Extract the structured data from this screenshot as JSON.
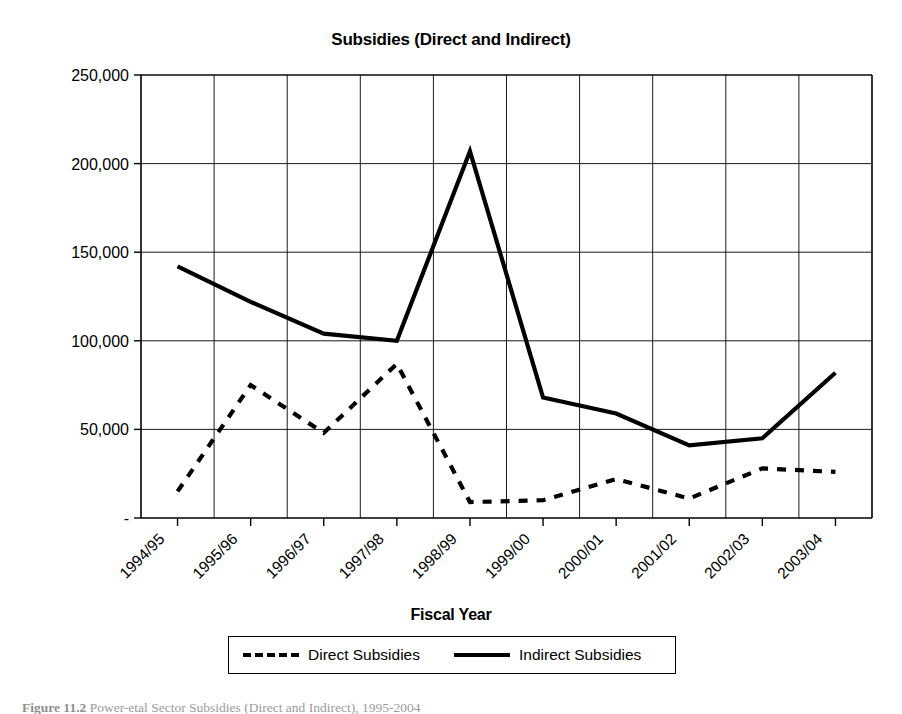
{
  "chart_data": {
    "type": "line",
    "title": "Subsidies (Direct and Indirect)",
    "xlabel": "Fiscal Year",
    "ylabel": "UGX million",
    "grid": true,
    "legend_position": "bottom",
    "ylim": [
      0,
      250000
    ],
    "ytick_values": [
      0,
      50000,
      100000,
      150000,
      200000,
      250000
    ],
    "ytick_labels": [
      "-",
      "50,000",
      "100,000",
      "150,000",
      "200,000",
      "250,000"
    ],
    "categories": [
      "1994/95",
      "1995/96",
      "1996/97",
      "1997/98",
      "1998/99",
      "1999/00",
      "2000/01",
      "2001/02",
      "2002/03",
      "2003/04"
    ],
    "series": [
      {
        "name": "Direct Subsidies",
        "style": "dashed",
        "color": "#000000",
        "values": [
          15000,
          75000,
          48000,
          87000,
          9000,
          10000,
          22000,
          11000,
          28000,
          26000
        ]
      },
      {
        "name": "Indirect Subsidies",
        "style": "solid",
        "color": "#000000",
        "values": [
          142000,
          122000,
          104000,
          100000,
          207000,
          68000,
          59000,
          41000,
          45000,
          82000
        ]
      }
    ]
  },
  "legend": {
    "entries": [
      {
        "label": "Direct Subsidies",
        "style": "dashed"
      },
      {
        "label": "Indirect Subsidies",
        "style": "solid"
      }
    ]
  },
  "caption": {
    "number": "Figure 11.2",
    "text": "Power-etal Sector Subsidies (Direct and Indirect), 1995-2004"
  }
}
